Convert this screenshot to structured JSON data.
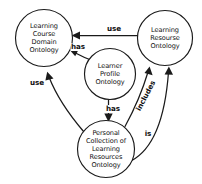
{
  "diagram": {
    "background_color": "#ffffff",
    "stroke_color": "#1a1a1a",
    "nodes": [
      {
        "id": "course-domain",
        "label": "Learning\nCourse\nDomain\nOntology",
        "cx": 44,
        "cy": 38,
        "r": 28.5
      },
      {
        "id": "learning-resourse",
        "label": "Learning\nResourse\nOntology",
        "cx": 165,
        "cy": 38,
        "r": 27.5
      },
      {
        "id": "learner-profile",
        "label": "Learner\nProfile\nOntology",
        "cx": 110,
        "cy": 74,
        "r": 25.5
      },
      {
        "id": "personal-collection",
        "label": "Personal\nCollection of\nLearning\nResources\nOntology",
        "cx": 106,
        "cy": 149,
        "r": 28.5
      }
    ],
    "edges": [
      {
        "id": "use-resourse-to-course",
        "label": "use",
        "from": "learning-resourse",
        "to": "course-domain",
        "label_x": 114,
        "label_y": 29
      },
      {
        "id": "has-profile-to-course",
        "label": "has",
        "from": "learner-profile",
        "to": "course-domain",
        "label_x": 78,
        "label_y": 47
      },
      {
        "id": "use-collection-to-course",
        "label": "use",
        "from": "personal-collection",
        "to": "course-domain",
        "label_x": 37,
        "label_y": 83
      },
      {
        "id": "has-profile-to-collection",
        "label": "has",
        "from": "learner-profile",
        "to": "personal-collection",
        "label_x": 113,
        "label_y": 109
      },
      {
        "id": "includes-collection-to-resourse",
        "label": "includes",
        "from": "personal-collection",
        "to": "learning-resourse",
        "label_x": 146,
        "label_y": 96
      },
      {
        "id": "is-collection-to-resourse",
        "label": "is",
        "from": "personal-collection",
        "to": "learning-resourse",
        "label_x": 148,
        "label_y": 134
      }
    ]
  }
}
